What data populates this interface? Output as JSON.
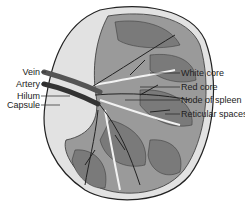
{
  "diagram": {
    "left_labels": [
      {
        "text": "Vein"
      },
      {
        "text": "Artery"
      },
      {
        "text": "Hilum"
      },
      {
        "text": "Capsule"
      }
    ],
    "right_labels": [
      {
        "text": "White core"
      },
      {
        "text": "Red core"
      },
      {
        "text": "Node of spleen"
      },
      {
        "text": "Reticular spaces"
      }
    ],
    "colors": {
      "outline": "#222222",
      "tissue_dark": "#7a7a7a",
      "tissue_mid": "#9a9a9a",
      "capsule_light": "#d8d8d8",
      "background": "#ffffff"
    }
  }
}
